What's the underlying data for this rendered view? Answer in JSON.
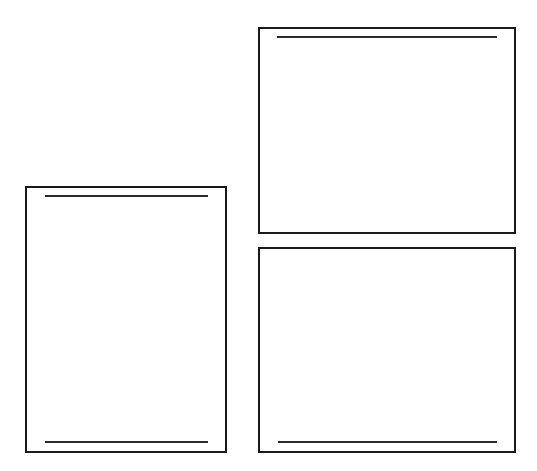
{
  "diagram": {
    "stroke_color": "#1a1a1a",
    "background_color": "#ffffff",
    "panels": [
      {
        "id": "left-panel",
        "orientation": "portrait",
        "box": {
          "x": 25,
          "y": 186,
          "w": 202,
          "h": 267
        },
        "rules": [
          {
            "position": "top",
            "x": 45,
            "y": 195,
            "w": 163
          },
          {
            "position": "bottom",
            "x": 45,
            "y": 441,
            "w": 163
          }
        ]
      },
      {
        "id": "top-right-panel",
        "orientation": "landscape",
        "box": {
          "x": 258,
          "y": 27,
          "w": 258,
          "h": 207
        },
        "rules": [
          {
            "position": "top",
            "x": 277,
            "y": 36,
            "w": 220
          }
        ]
      },
      {
        "id": "bottom-right-panel",
        "orientation": "landscape",
        "box": {
          "x": 258,
          "y": 247,
          "w": 258,
          "h": 206
        },
        "rules": [
          {
            "position": "bottom",
            "x": 278,
            "y": 441,
            "w": 219
          }
        ]
      }
    ]
  }
}
